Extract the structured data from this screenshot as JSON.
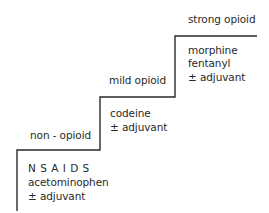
{
  "diagram": {
    "type": "analgesic-ladder",
    "steps": [
      {
        "label": "non - opioid",
        "drugs": [
          "N S A I D S",
          "acetominophen",
          "± adjuvant"
        ]
      },
      {
        "label": "mild opioid",
        "drugs": [
          "codeine",
          "± adjuvant"
        ]
      },
      {
        "label": "strong opioid",
        "drugs": [
          "morphine",
          "fentanyl",
          "± adjuvant"
        ]
      }
    ],
    "colors": {
      "line": "#2a2a2a",
      "text": "#2a2a2a",
      "background": "#ffffff"
    }
  }
}
